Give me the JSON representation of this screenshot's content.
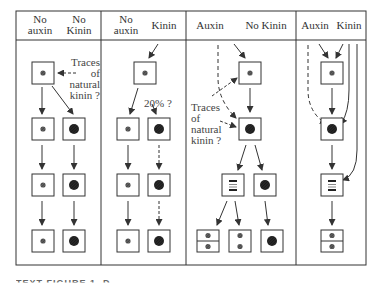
{
  "figure": {
    "panels": [
      {
        "id": "panel-1",
        "header_left": [
          "No",
          "auxin"
        ],
        "header_right": [
          "No",
          "Kinin"
        ],
        "annotation": [
          "Traces",
          "of",
          "natural",
          "kinin ?"
        ]
      },
      {
        "id": "panel-2",
        "header_left": [
          "No",
          "auxin"
        ],
        "header_right": [
          "Kinin"
        ],
        "annotation": [
          "20% ?"
        ]
      },
      {
        "id": "panel-3",
        "header_left": [
          "Auxin"
        ],
        "header_right": [
          "No Kinin"
        ],
        "annotation": [
          "Traces",
          "of",
          "natural",
          "kinin ?"
        ]
      },
      {
        "id": "panel-4",
        "header_left": [
          "Auxin"
        ],
        "header_right": [
          "Kinin"
        ]
      }
    ],
    "caption": "TEXT FIGURE 1. D"
  },
  "colors": {
    "line": "#333333",
    "nucleus_small": "#777777",
    "nucleus_large": "#222222",
    "background": "#ffffff"
  }
}
